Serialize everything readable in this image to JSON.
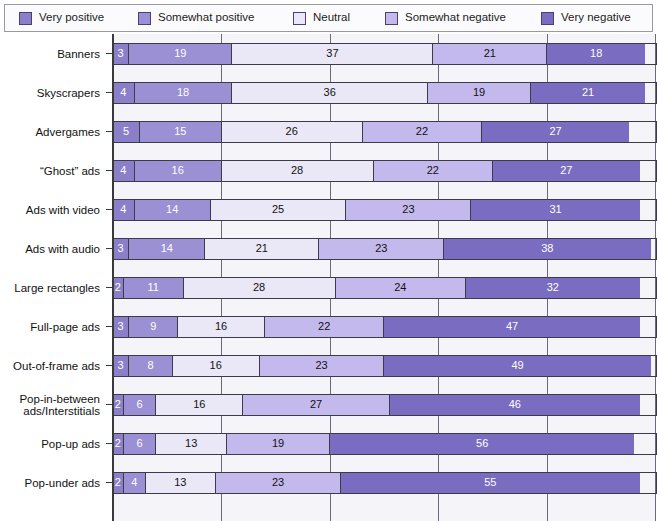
{
  "legend": {
    "items": [
      {
        "label": "Very positive",
        "color": "#8c7fc9"
      },
      {
        "label": "Somewhat positive",
        "color": "#9b90d3"
      },
      {
        "label": "Neutral",
        "color": "#eae7f7"
      },
      {
        "label": "Somewhat negative",
        "color": "#c3b9ec"
      },
      {
        "label": "Very negative",
        "color": "#7a6cc0"
      }
    ]
  },
  "chart_data": {
    "type": "bar",
    "orientation": "horizontal",
    "stacked": true,
    "stack_mode": "percent",
    "title": "",
    "xlabel": "",
    "ylabel": "",
    "xlim": [
      0,
      100
    ],
    "grid": true,
    "gridlines": [
      20,
      40,
      60,
      80
    ],
    "legend_position": "top",
    "categories": [
      "Banners",
      "Skyscrapers",
      "Advergames",
      "“Ghost” ads",
      "Ads with video",
      "Ads with audio",
      "Large rectangles",
      "Full-page ads",
      "Out-of-frame ads",
      "Pop-in-between ads/Interstitials",
      "Pop-up ads",
      "Pop-under ads"
    ],
    "series": [
      {
        "name": "Very positive",
        "color": "#8c7fc9",
        "values": [
          3,
          4,
          5,
          4,
          4,
          3,
          2,
          3,
          3,
          2,
          2,
          2
        ]
      },
      {
        "name": "Somewhat positive",
        "color": "#9b90d3",
        "values": [
          19,
          18,
          15,
          16,
          14,
          14,
          11,
          9,
          8,
          6,
          6,
          4
        ]
      },
      {
        "name": "Neutral",
        "color": "#eae7f7",
        "values": [
          37,
          36,
          26,
          28,
          25,
          21,
          28,
          16,
          16,
          16,
          13,
          13
        ]
      },
      {
        "name": "Somewhat negative",
        "color": "#c3b9ec",
        "values": [
          21,
          19,
          22,
          22,
          23,
          23,
          24,
          22,
          23,
          27,
          19,
          23
        ]
      },
      {
        "name": "Very negative",
        "color": "#7a6cc0",
        "values": [
          18,
          21,
          27,
          27,
          31,
          38,
          32,
          47,
          49,
          46,
          56,
          55
        ]
      }
    ],
    "label_text_colors": {
      "Very positive": "#ffffff",
      "Somewhat positive": "#ffffff",
      "Neutral": "#111111",
      "Somewhat negative": "#111111",
      "Very negative": "#ffffff"
    }
  },
  "rows": [
    {
      "label": "Banners",
      "label2": "",
      "values": [
        3,
        19,
        37,
        21,
        18
      ]
    },
    {
      "label": "Skyscrapers",
      "label2": "",
      "values": [
        4,
        18,
        36,
        19,
        21
      ]
    },
    {
      "label": "Advergames",
      "label2": "",
      "values": [
        5,
        15,
        26,
        22,
        27
      ]
    },
    {
      "label": "“Ghost” ads",
      "label2": "",
      "values": [
        4,
        16,
        28,
        22,
        27
      ]
    },
    {
      "label": "Ads with video",
      "label2": "",
      "values": [
        4,
        14,
        25,
        23,
        31
      ]
    },
    {
      "label": "Ads with audio",
      "label2": "",
      "values": [
        3,
        14,
        21,
        23,
        38
      ]
    },
    {
      "label": "Large rectangles",
      "label2": "",
      "values": [
        2,
        11,
        28,
        24,
        32
      ]
    },
    {
      "label": "Full-page ads",
      "label2": "",
      "values": [
        3,
        9,
        16,
        22,
        47
      ]
    },
    {
      "label": "Out-of-frame ads",
      "label2": "",
      "values": [
        3,
        8,
        16,
        23,
        49
      ]
    },
    {
      "label": "Pop-in-between",
      "label2": "ads/Interstitials",
      "values": [
        2,
        6,
        16,
        27,
        46
      ]
    },
    {
      "label": "Pop-up ads",
      "label2": "",
      "values": [
        2,
        6,
        13,
        19,
        56
      ]
    },
    {
      "label": "Pop-under ads",
      "label2": "",
      "values": [
        2,
        4,
        13,
        23,
        55
      ]
    }
  ]
}
